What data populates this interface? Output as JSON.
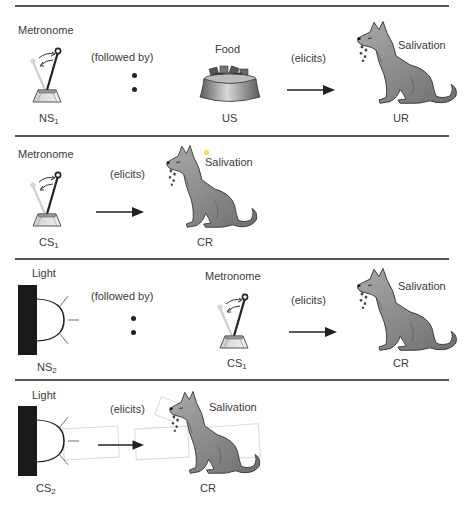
{
  "figure": {
    "colors": {
      "divider": "#555555",
      "dog": "#8a8a8a",
      "light_block": "#1a1a1a",
      "text": "#3a3a3a"
    }
  },
  "panels": [
    {
      "id": "panel-1",
      "stimulus_label": "Metronome",
      "stimulus_code": "NS",
      "stimulus_sub": "1",
      "connector": "(followed by)",
      "second_label": "Food",
      "second_code": "US",
      "relation": "(elicits)",
      "response_label": "Salivation",
      "response_code": "UR"
    },
    {
      "id": "panel-2",
      "stimulus_label": "Metronome",
      "stimulus_code": "CS",
      "stimulus_sub": "1",
      "relation": "(elicits)",
      "response_label": "Salivation",
      "response_code": "CR"
    },
    {
      "id": "panel-3",
      "stimulus_label": "Light",
      "stimulus_code": "NS",
      "stimulus_sub": "2",
      "connector": "(followed by)",
      "second_label": "Metronome",
      "second_code": "CS",
      "second_sub": "1",
      "relation": "(elicits)",
      "response_label": "Salivation",
      "response_code": "CR"
    },
    {
      "id": "panel-4",
      "stimulus_label": "Light",
      "stimulus_code": "CS",
      "stimulus_sub": "2",
      "relation": "(elicits)",
      "response_label": "Salivation",
      "response_code": "CR"
    }
  ],
  "icons": {
    "metronome": "metronome-icon",
    "food": "food-bowl-icon",
    "dog": "salivating-dog-icon",
    "light": "light-bulb-icon",
    "arrow": "right-arrow-icon"
  }
}
